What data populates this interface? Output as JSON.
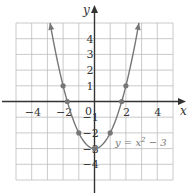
{
  "chart_data": {
    "type": "line",
    "title": "",
    "equation_label": "y = x² − 3",
    "equation_parts": {
      "lhs": "y = x",
      "exp": "2",
      "rhs": " − 3"
    },
    "xlabel": "x",
    "ylabel": "y",
    "xlim": [
      -5,
      5
    ],
    "ylim": [
      -5,
      5
    ],
    "grid": true,
    "x_ticks": [
      -4,
      -2,
      2,
      4
    ],
    "y_ticks": [
      4,
      3,
      2,
      1,
      -1,
      -2,
      -3,
      -4
    ],
    "origin_label": "0",
    "series": [
      {
        "name": "y = x^2 - 3",
        "function": "x^2 - 3",
        "x_range": [
          -2.83,
          2.83
        ],
        "arrows_at_ends": true,
        "marked_points": [
          {
            "x": -2,
            "y": 1
          },
          {
            "x": -1.732,
            "y": 0
          },
          {
            "x": -1,
            "y": -2
          },
          {
            "x": 0,
            "y": -3
          },
          {
            "x": 1,
            "y": -2
          },
          {
            "x": 1.732,
            "y": 0
          },
          {
            "x": 2,
            "y": 1
          }
        ]
      }
    ],
    "colors": {
      "grid": "#bdbdbd",
      "axes": "#333333",
      "curve": "#777777",
      "points": "#777777"
    }
  }
}
